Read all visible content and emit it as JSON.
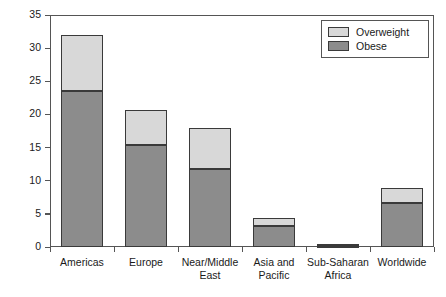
{
  "chart_data": {
    "type": "bar",
    "subtype": "stacked-vertical",
    "title": "",
    "xlabel": "",
    "ylabel": "Prevalence (%)",
    "ylim": [
      0,
      35
    ],
    "yticks": [
      0,
      5,
      10,
      15,
      20,
      25,
      30,
      35
    ],
    "ytick_labels": [
      "0",
      "5",
      "10",
      "15",
      "20",
      "25",
      "30",
      "35"
    ],
    "grid": false,
    "legend_position": "top-right",
    "categories": [
      "Americas",
      "Europe",
      "Near/Middle\nEast",
      "Asia and\nPacific",
      "Sub-Saharan\nAfrica",
      "Worldwide"
    ],
    "series": [
      {
        "name": "Obese",
        "color": "#8c8c8c",
        "values": [
          23.6,
          15.4,
          11.7,
          3.1,
          0.2,
          6.6
        ]
      },
      {
        "name": "Overweight",
        "color": "#d8d8d8",
        "values": [
          8.4,
          5.3,
          6.2,
          1.2,
          0.2,
          2.3
        ]
      }
    ],
    "totals": [
      32.0,
      20.7,
      17.9,
      4.3,
      0.4,
      8.9
    ],
    "annotations": []
  },
  "legend": {
    "items": [
      {
        "label": "Overweight",
        "color": "#d8d8d8"
      },
      {
        "label": "Obese",
        "color": "#8c8c8c"
      }
    ]
  }
}
